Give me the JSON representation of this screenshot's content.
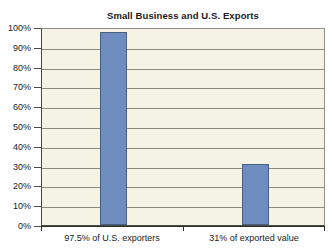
{
  "chart_data": {
    "type": "bar",
    "title": "Small Business and U.S. Exports",
    "xlabel": "",
    "ylabel": "",
    "categories": [
      "97.5% of U.S. exporters",
      "31% of exported value"
    ],
    "values": [
      97.5,
      31
    ],
    "ylim": [
      0,
      100
    ],
    "ytick_labels": [
      "100%",
      "90%",
      "80%",
      "70%",
      "60%",
      "50%",
      "40%",
      "30%",
      "20%",
      "10%",
      "0%"
    ],
    "ytick_values": [
      100,
      90,
      80,
      70,
      60,
      50,
      40,
      30,
      20,
      10,
      0
    ],
    "grid": true,
    "legend": false,
    "series": [
      {
        "name": "Share",
        "values": [
          97.5,
          31
        ]
      }
    ],
    "colors": {
      "bar_fill": "#6E8DBE",
      "bar_border": "#4A5F84",
      "plot_background": "#F5F3E3",
      "gridline": "#8A8A80",
      "axis": "#2E2E2A",
      "text": "#1A1A1A",
      "page_background": "#FFFFFF"
    }
  }
}
